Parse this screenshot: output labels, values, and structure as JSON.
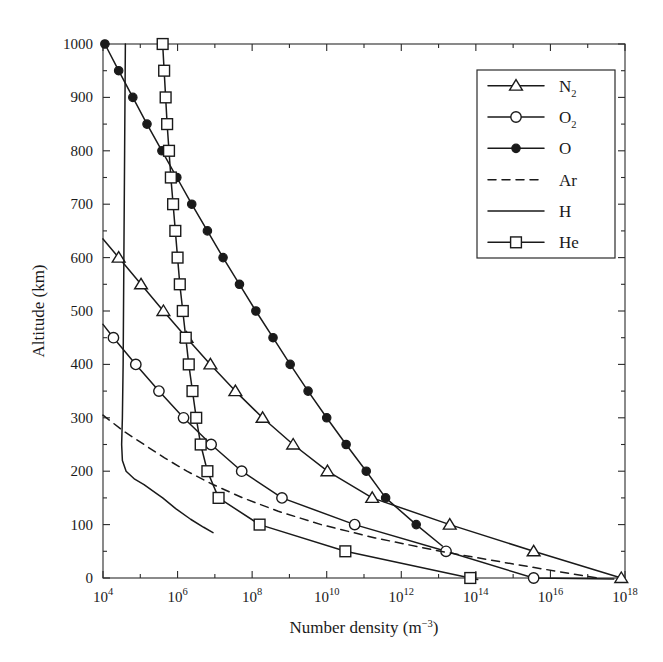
{
  "chart_data": {
    "type": "line",
    "title": "",
    "xlabel": "Number density (m−3)",
    "ylabel": "Altitude (km)",
    "xscale": "log",
    "xlim": [
      10000.0,
      1e+18
    ],
    "ylim": [
      0,
      1000
    ],
    "xticks": [
      10000.0,
      1000000.0,
      100000000.0,
      10000000000.0,
      1000000000000.0,
      100000000000000.0,
      1e+16,
      1e+18
    ],
    "xtick_labels": [
      "10⁴",
      "10⁶",
      "10⁸",
      "10¹⁰",
      "10¹²",
      "10¹⁴",
      "10¹⁶",
      "10¹⁸"
    ],
    "xtick_mantissas": [
      "10",
      "10",
      "10",
      "10",
      "10",
      "10",
      "10",
      "10"
    ],
    "xtick_exponents": [
      "4",
      "6",
      "8",
      "10",
      "12",
      "14",
      "16",
      "18"
    ],
    "yticks": [
      0,
      100,
      200,
      300,
      400,
      500,
      600,
      700,
      800,
      900,
      1000
    ],
    "ytick_labels": [
      "0",
      "100",
      "200",
      "300",
      "400",
      "500",
      "600",
      "700",
      "800",
      "900",
      "1000"
    ],
    "yminor_step": 50,
    "grid": false,
    "legend_position": "upper right",
    "series": [
      {
        "name": "N2",
        "label": "N",
        "label_sub": "2",
        "marker": "triangle-open",
        "linestyle": "solid",
        "marker_step_km": 50,
        "points": [
          {
            "alt": 635,
            "logn": 4.0
          },
          {
            "alt": 600,
            "logn": 4.42
          },
          {
            "alt": 550,
            "logn": 5.02
          },
          {
            "alt": 500,
            "logn": 5.62
          },
          {
            "alt": 450,
            "logn": 6.24
          },
          {
            "alt": 400,
            "logn": 6.88
          },
          {
            "alt": 350,
            "logn": 7.55
          },
          {
            "alt": 300,
            "logn": 8.28
          },
          {
            "alt": 250,
            "logn": 9.1
          },
          {
            "alt": 200,
            "logn": 10.02
          },
          {
            "alt": 150,
            "logn": 11.22
          },
          {
            "alt": 100,
            "logn": 13.3
          },
          {
            "alt": 50,
            "logn": 15.55
          },
          {
            "alt": 0,
            "logn": 17.9
          }
        ]
      },
      {
        "name": "O2",
        "label": "O",
        "label_sub": "2",
        "marker": "circle-open",
        "linestyle": "solid",
        "marker_step_km": 50,
        "points": [
          {
            "alt": 475,
            "logn": 4.0
          },
          {
            "alt": 450,
            "logn": 4.28
          },
          {
            "alt": 400,
            "logn": 4.88
          },
          {
            "alt": 350,
            "logn": 5.5
          },
          {
            "alt": 300,
            "logn": 6.16
          },
          {
            "alt": 250,
            "logn": 6.9
          },
          {
            "alt": 200,
            "logn": 7.72
          },
          {
            "alt": 150,
            "logn": 8.8
          },
          {
            "alt": 100,
            "logn": 10.75
          },
          {
            "alt": 50,
            "logn": 13.2
          },
          {
            "alt": 0,
            "logn": 15.55
          },
          {
            "alt": -2,
            "logn": 17.7
          }
        ]
      },
      {
        "name": "O",
        "label": "O",
        "label_sub": "",
        "marker": "circle-filled",
        "linestyle": "solid",
        "marker_step_km": 50,
        "points": [
          {
            "alt": 1000,
            "logn": 4.05
          },
          {
            "alt": 950,
            "logn": 4.42
          },
          {
            "alt": 900,
            "logn": 4.8
          },
          {
            "alt": 850,
            "logn": 5.18
          },
          {
            "alt": 800,
            "logn": 5.58
          },
          {
            "alt": 750,
            "logn": 5.98
          },
          {
            "alt": 700,
            "logn": 6.38
          },
          {
            "alt": 650,
            "logn": 6.8
          },
          {
            "alt": 600,
            "logn": 7.22
          },
          {
            "alt": 550,
            "logn": 7.66
          },
          {
            "alt": 500,
            "logn": 8.1
          },
          {
            "alt": 450,
            "logn": 8.56
          },
          {
            "alt": 400,
            "logn": 9.02
          },
          {
            "alt": 350,
            "logn": 9.5
          },
          {
            "alt": 300,
            "logn": 10.0
          },
          {
            "alt": 250,
            "logn": 10.52
          },
          {
            "alt": 200,
            "logn": 11.06
          },
          {
            "alt": 150,
            "logn": 11.58
          },
          {
            "alt": 100,
            "logn": 12.4
          },
          {
            "alt": 60,
            "logn": 13.1
          }
        ]
      },
      {
        "name": "Ar",
        "label": "Ar",
        "label_sub": "",
        "marker": "none",
        "linestyle": "dashed",
        "points": [
          {
            "alt": 305,
            "logn": 4.0
          },
          {
            "alt": 275,
            "logn": 4.55
          },
          {
            "alt": 250,
            "logn": 5.1
          },
          {
            "alt": 225,
            "logn": 5.65
          },
          {
            "alt": 200,
            "logn": 6.25
          },
          {
            "alt": 175,
            "logn": 6.95
          },
          {
            "alt": 150,
            "logn": 7.75
          },
          {
            "alt": 125,
            "logn": 8.7
          },
          {
            "alt": 100,
            "logn": 9.85
          },
          {
            "alt": 75,
            "logn": 11.3
          },
          {
            "alt": 50,
            "logn": 13.05
          },
          {
            "alt": 25,
            "logn": 15.1
          },
          {
            "alt": 0,
            "logn": 17.25
          }
        ]
      },
      {
        "name": "H",
        "label": "H",
        "label_sub": "",
        "marker": "none",
        "linestyle": "solid",
        "points": [
          {
            "alt": 1000,
            "logn": 4.6
          },
          {
            "alt": 800,
            "logn": 4.58
          },
          {
            "alt": 600,
            "logn": 4.56
          },
          {
            "alt": 400,
            "logn": 4.54
          },
          {
            "alt": 300,
            "logn": 4.52
          },
          {
            "alt": 250,
            "logn": 4.5
          },
          {
            "alt": 220,
            "logn": 4.52
          },
          {
            "alt": 200,
            "logn": 4.62
          },
          {
            "alt": 185,
            "logn": 4.85
          },
          {
            "alt": 175,
            "logn": 5.1
          },
          {
            "alt": 160,
            "logn": 5.4
          },
          {
            "alt": 150,
            "logn": 5.6
          },
          {
            "alt": 130,
            "logn": 5.95
          },
          {
            "alt": 110,
            "logn": 6.35
          },
          {
            "alt": 95,
            "logn": 6.7
          },
          {
            "alt": 85,
            "logn": 6.95
          }
        ]
      },
      {
        "name": "He",
        "label": "He",
        "label_sub": "",
        "marker": "square-open",
        "linestyle": "solid",
        "marker_step_km": 50,
        "points": [
          {
            "alt": 1000,
            "logn": 5.6
          },
          {
            "alt": 950,
            "logn": 5.64
          },
          {
            "alt": 900,
            "logn": 5.68
          },
          {
            "alt": 850,
            "logn": 5.72
          },
          {
            "alt": 800,
            "logn": 5.77
          },
          {
            "alt": 750,
            "logn": 5.82
          },
          {
            "alt": 700,
            "logn": 5.88
          },
          {
            "alt": 650,
            "logn": 5.94
          },
          {
            "alt": 600,
            "logn": 6.0
          },
          {
            "alt": 550,
            "logn": 6.06
          },
          {
            "alt": 500,
            "logn": 6.14
          },
          {
            "alt": 450,
            "logn": 6.22
          },
          {
            "alt": 400,
            "logn": 6.3
          },
          {
            "alt": 350,
            "logn": 6.4
          },
          {
            "alt": 300,
            "logn": 6.5
          },
          {
            "alt": 250,
            "logn": 6.62
          },
          {
            "alt": 200,
            "logn": 6.8
          },
          {
            "alt": 150,
            "logn": 7.1
          },
          {
            "alt": 100,
            "logn": 8.2
          },
          {
            "alt": 50,
            "logn": 10.5
          },
          {
            "alt": 0,
            "logn": 13.85
          },
          {
            "alt": -3,
            "logn": 14.05
          }
        ]
      }
    ],
    "legend_entries": [
      {
        "label": "N",
        "sub": "2",
        "marker": "triangle-open",
        "linestyle": "solid"
      },
      {
        "label": "O",
        "sub": "2",
        "marker": "circle-open",
        "linestyle": "solid"
      },
      {
        "label": "O",
        "sub": "",
        "marker": "circle-filled",
        "linestyle": "solid"
      },
      {
        "label": "Ar",
        "sub": "",
        "marker": "none",
        "linestyle": "dashed"
      },
      {
        "label": "H",
        "sub": "",
        "marker": "none",
        "linestyle": "solid"
      },
      {
        "label": "He",
        "sub": "",
        "marker": "square-open",
        "linestyle": "solid"
      }
    ]
  },
  "axes": {
    "x_title_main": "Number density (m",
    "x_title_sup": "−3",
    "x_title_tail": ")",
    "y_title": "Altitude (km)"
  },
  "colors": {
    "line": "#1a1a1a",
    "frame": "#2b2b2b",
    "background": "#ffffff"
  }
}
